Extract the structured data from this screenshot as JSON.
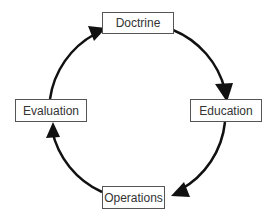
{
  "diagram": {
    "type": "cycle",
    "nodes": [
      {
        "id": "doctrine",
        "label": "Doctrine"
      },
      {
        "id": "education",
        "label": "Education"
      },
      {
        "id": "operations",
        "label": "Operations"
      },
      {
        "id": "evaluation",
        "label": "Evaluation"
      }
    ],
    "edges": [
      {
        "from": "doctrine",
        "to": "education"
      },
      {
        "from": "education",
        "to": "operations"
      },
      {
        "from": "operations",
        "to": "evaluation"
      },
      {
        "from": "evaluation",
        "to": "doctrine"
      }
    ],
    "colors": {
      "arrow": "#111111",
      "box_border": "#555555",
      "text": "#333333"
    }
  }
}
